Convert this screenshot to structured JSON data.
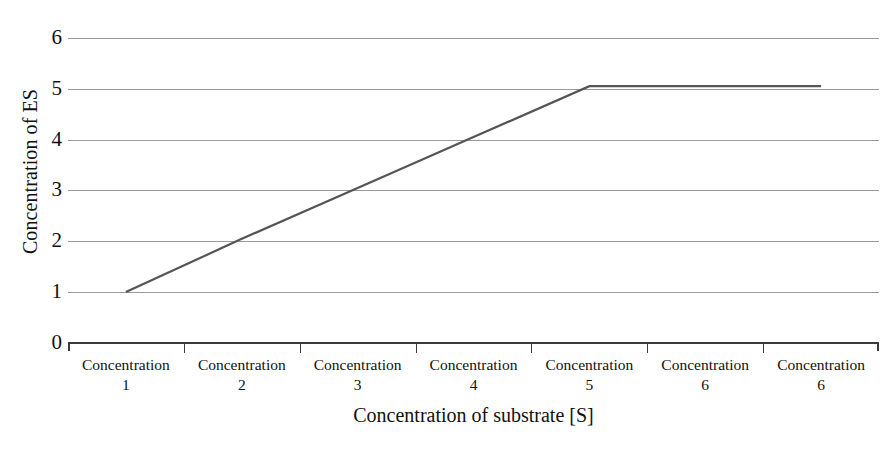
{
  "chart_data": {
    "type": "line",
    "title": "",
    "xlabel": "Concentration of substrate [S]",
    "ylabel": "Concentration of ES",
    "categories": [
      "Concentration 1",
      "Concentration 2",
      "Concentration 3",
      "Concentration 4",
      "Concentration 5",
      "Concentration 6",
      "Concentration 6"
    ],
    "category_names": [
      "Concentration",
      "Concentration",
      "Concentration",
      "Concentration",
      "Concentration",
      "Concentration",
      "Concentration"
    ],
    "category_numbers": [
      "1",
      "2",
      "3",
      "4",
      "5",
      "6",
      "6"
    ],
    "values": [
      1.0,
      2.05,
      3.05,
      4.05,
      5.05,
      5.05,
      5.05
    ],
    "series": [
      {
        "name": "Concentration of ES",
        "values": [
          1.0,
          2.05,
          3.05,
          4.05,
          5.05,
          5.05,
          5.05
        ],
        "color": "#555555"
      }
    ],
    "y_ticks": [
      0,
      1,
      2,
      3,
      4,
      5,
      6
    ],
    "y_tick_labels": [
      "0",
      "1",
      "2",
      "3",
      "4",
      "5",
      "6"
    ],
    "ylim": [
      0,
      6
    ],
    "grid": true,
    "grid_color": "#9a9a9a",
    "axis_color": "#3a3a3a",
    "legend": "none",
    "background": "#ffffff",
    "line_truncated_at_category": 7
  },
  "axes": {
    "y_title": "Concentration of ES",
    "x_title": "Concentration of substrate [S]"
  }
}
